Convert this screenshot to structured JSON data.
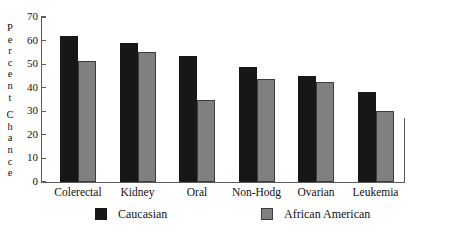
{
  "chart_data": {
    "type": "bar",
    "title": "",
    "xlabel": "",
    "ylabel": "Percent Chance",
    "ylabel_lines": [
      "P",
      "e",
      "r",
      "c",
      "e",
      "n",
      "t",
      "C",
      "h",
      "a",
      "n",
      "c",
      "e"
    ],
    "ylim": [
      0,
      70
    ],
    "ytick_values": [
      0,
      10,
      20,
      30,
      40,
      50,
      60,
      70
    ],
    "ytick_labels": [
      "0",
      "10",
      "20",
      "30",
      "40",
      "50",
      "60",
      "70"
    ],
    "grid": false,
    "legend_position": "bottom",
    "categories": [
      "Colerectal",
      "Kidney",
      "Oral",
      "Non-Hodg",
      "Ovarian",
      "Leukemia"
    ],
    "series": [
      {
        "name": "Caucasian",
        "color": "#171717",
        "values": [
          62,
          59,
          53.5,
          49,
          45,
          38
        ]
      },
      {
        "name": "African American",
        "color": "#808080",
        "values": [
          51.5,
          55,
          35,
          43.5,
          42.5,
          30
        ]
      }
    ]
  },
  "legend": {
    "items": [
      {
        "label": "Caucasian",
        "swatch": "black-square-swatch"
      },
      {
        "label": "African American",
        "swatch": "gray-square-swatch"
      }
    ]
  }
}
